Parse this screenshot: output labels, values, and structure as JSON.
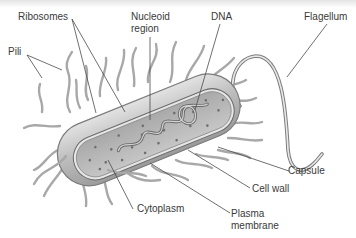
{
  "diagram": {
    "colors": {
      "background": "#ffffff",
      "line": "#555555",
      "cell_fill": "#c8c8c8",
      "cytoplasm_fill": "#b9b9b9",
      "text": "#3a3a3a"
    },
    "labels": [
      {
        "id": "ribosomes",
        "text": "Ribosomes"
      },
      {
        "id": "nucleoid",
        "text": "Nucleoid",
        "text2": "region"
      },
      {
        "id": "dna",
        "text": "DNA"
      },
      {
        "id": "flagellum",
        "text": "Flagellum"
      },
      {
        "id": "pili",
        "text": "Pili"
      },
      {
        "id": "capsule",
        "text": "Capsule"
      },
      {
        "id": "cell-wall",
        "text": "Cell wall"
      },
      {
        "id": "cytoplasm",
        "text": "Cytoplasm"
      },
      {
        "id": "plasma-membrane",
        "text": "Plasma",
        "text2": "membrane"
      }
    ]
  }
}
